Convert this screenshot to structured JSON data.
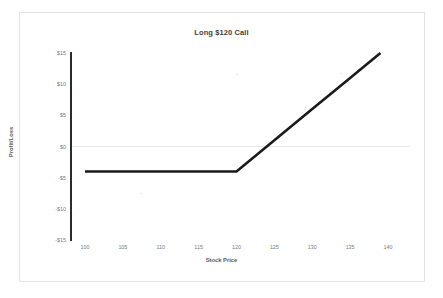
{
  "chart_data": {
    "type": "line",
    "title": "Long $120 Call",
    "xlabel": "Stock Price",
    "ylabel": "Profit/Loss",
    "xlim": [
      100,
      140
    ],
    "ylim": [
      -15,
      15
    ],
    "grid": false,
    "zero_line": true,
    "legend": "none",
    "strike": 120,
    "premium": 4,
    "breakeven": 124,
    "x_ticks": [
      "100",
      "105",
      "110",
      "115",
      "120",
      "125",
      "130",
      "135",
      "140"
    ],
    "x_tick_values": [
      100,
      105,
      110,
      115,
      120,
      125,
      130,
      135,
      140
    ],
    "y_ticks": [
      "$15",
      "$10",
      "$5",
      "$0",
      "-$5",
      "-$10",
      "-$15"
    ],
    "y_tick_values": [
      15,
      10,
      5,
      0,
      -5,
      -10,
      -15
    ],
    "series": [
      {
        "name": "Long $120 Call payoff",
        "color": "#1a1a1a",
        "x": [
          100,
          105,
          110,
          115,
          120,
          125,
          130,
          135,
          140
        ],
        "values": [
          -4,
          -4,
          -4,
          -4,
          -4,
          1,
          6,
          11,
          16
        ]
      }
    ]
  },
  "chart": {
    "title": "Long $120 Call",
    "x_axis_title": "Stock Price",
    "y_axis_title": "Profit/Loss"
  }
}
